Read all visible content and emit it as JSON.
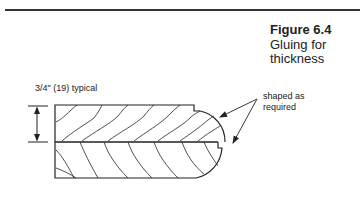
{
  "figure": {
    "number": "Figure 6.4",
    "title_lines": [
      "Gluing for",
      "thickness"
    ]
  },
  "annotations": {
    "dimension_label": "3/4\" (19) typical",
    "shape_label_lines": [
      "shaped as",
      "required"
    ]
  },
  "diagram": {
    "parts": [
      "top-board",
      "bottom-board",
      "glue-line",
      "dimension-arrow",
      "leader-arrows"
    ],
    "colors": {
      "line": "#222222",
      "background": "#ffffff"
    }
  }
}
